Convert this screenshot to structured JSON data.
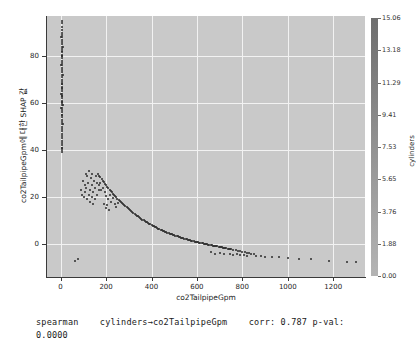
{
  "figure": {
    "background": "#ffffff",
    "plot_background": "#c9c9c9",
    "grid_color": "#f2f2f2",
    "point_color": "#2b2b2b"
  },
  "chart_data": {
    "type": "scatter",
    "title": "",
    "xlabel": "co2TailpipeGpm",
    "ylabel": "co2TailpipeGpm에 대한 SHAP 값",
    "xlim": [
      -60,
      1340
    ],
    "ylim": [
      -14,
      97
    ],
    "xticks": [
      0,
      200,
      400,
      600,
      800,
      1000,
      1200
    ],
    "xticklabels": [
      "0",
      "200",
      "400",
      "600",
      "800",
      "1000",
      "1200"
    ],
    "yticks": [
      0,
      20,
      40,
      60,
      80
    ],
    "yticklabels": [
      "0",
      "20",
      "40",
      "60",
      "80"
    ],
    "grid": true,
    "legend": "none",
    "colorbar": {
      "label": "cylinders",
      "ticks": [
        15.06,
        13.18,
        11.29,
        9.41,
        7.53,
        5.65,
        3.76,
        1.88,
        0.0
      ],
      "ticklabels": [
        "15.06",
        "13.18",
        "11.29",
        "9.41",
        "7.53",
        "5.65",
        "3.76",
        "1.88",
        "0.00"
      ],
      "vmin": 0.0,
      "vmax": 15.06
    },
    "points": [
      [
        4,
        95
      ],
      [
        6,
        94
      ],
      [
        5,
        92.5
      ],
      [
        7,
        91
      ],
      [
        4,
        90
      ],
      [
        6,
        89
      ],
      [
        5,
        88
      ],
      [
        7,
        87
      ],
      [
        4,
        86
      ],
      [
        6,
        85
      ],
      [
        5,
        84
      ],
      [
        7,
        83
      ],
      [
        4,
        82
      ],
      [
        6,
        81.5
      ],
      [
        5,
        80.5
      ],
      [
        7,
        80
      ],
      [
        4,
        79
      ],
      [
        6,
        78
      ],
      [
        5,
        77
      ],
      [
        7,
        76
      ],
      [
        4,
        75
      ],
      [
        6,
        74
      ],
      [
        5,
        73
      ],
      [
        7,
        72
      ],
      [
        4,
        71
      ],
      [
        6,
        70
      ],
      [
        5,
        69
      ],
      [
        7,
        68
      ],
      [
        4,
        67
      ],
      [
        6,
        66.5
      ],
      [
        5,
        66
      ],
      [
        7,
        65
      ],
      [
        4,
        64
      ],
      [
        6,
        63
      ],
      [
        5,
        62
      ],
      [
        7,
        61
      ],
      [
        4,
        60.5
      ],
      [
        6,
        60
      ],
      [
        5,
        59
      ],
      [
        7,
        58
      ],
      [
        4,
        57
      ],
      [
        6,
        56
      ],
      [
        5,
        55
      ],
      [
        7,
        54
      ],
      [
        4,
        53
      ],
      [
        6,
        52
      ],
      [
        5,
        51
      ],
      [
        7,
        50
      ],
      [
        4,
        49
      ],
      [
        6,
        48
      ],
      [
        5,
        47
      ],
      [
        7,
        46
      ],
      [
        4,
        45
      ],
      [
        6,
        44
      ],
      [
        5,
        43
      ],
      [
        7,
        42
      ],
      [
        4,
        41
      ],
      [
        6,
        40
      ],
      [
        8,
        68
      ],
      [
        9,
        72
      ],
      [
        8,
        80
      ],
      [
        9,
        84
      ],
      [
        8,
        63
      ],
      [
        9,
        59
      ],
      [
        8,
        55
      ],
      [
        9,
        51
      ],
      [
        3,
        88
      ],
      [
        3,
        76
      ],
      [
        3,
        64
      ],
      [
        3,
        58
      ],
      [
        5,
        41
      ],
      [
        7,
        39
      ],
      [
        110,
        30
      ],
      [
        118,
        29
      ],
      [
        125,
        31
      ],
      [
        132,
        28
      ],
      [
        140,
        30
      ],
      [
        148,
        27
      ],
      [
        155,
        29
      ],
      [
        162,
        26
      ],
      [
        98,
        27
      ],
      [
        105,
        25
      ],
      [
        112,
        24
      ],
      [
        120,
        26
      ],
      [
        128,
        23
      ],
      [
        136,
        25
      ],
      [
        144,
        22
      ],
      [
        152,
        24
      ],
      [
        160,
        21
      ],
      [
        168,
        23
      ],
      [
        88,
        23
      ],
      [
        95,
        21
      ],
      [
        102,
        20
      ],
      [
        109,
        22
      ],
      [
        116,
        19
      ],
      [
        123,
        21
      ],
      [
        130,
        18
      ],
      [
        137,
        20
      ],
      [
        144,
        17
      ],
      [
        151,
        19
      ],
      [
        165,
        30
      ],
      [
        170,
        29
      ],
      [
        175,
        28.5
      ],
      [
        180,
        27.8
      ],
      [
        185,
        27
      ],
      [
        190,
        26.3
      ],
      [
        195,
        25.7
      ],
      [
        200,
        25
      ],
      [
        205,
        24.4
      ],
      [
        210,
        23.8
      ],
      [
        215,
        23.2
      ],
      [
        220,
        22.6
      ],
      [
        225,
        22
      ],
      [
        230,
        21.5
      ],
      [
        235,
        21
      ],
      [
        240,
        20.4
      ],
      [
        245,
        19.9
      ],
      [
        250,
        19.4
      ],
      [
        255,
        18.9
      ],
      [
        260,
        18.4
      ],
      [
        265,
        17.9
      ],
      [
        270,
        17.4
      ],
      [
        275,
        17
      ],
      [
        280,
        16.5
      ],
      [
        285,
        16.1
      ],
      [
        290,
        15.6
      ],
      [
        295,
        15.2
      ],
      [
        300,
        14.8
      ],
      [
        305,
        14.4
      ],
      [
        310,
        14
      ],
      [
        315,
        13.6
      ],
      [
        320,
        13.2
      ],
      [
        325,
        12.8
      ],
      [
        330,
        12.5
      ],
      [
        335,
        12.1
      ],
      [
        340,
        11.8
      ],
      [
        345,
        11.4
      ],
      [
        350,
        11.1
      ],
      [
        355,
        10.8
      ],
      [
        360,
        10.4
      ],
      [
        365,
        10.1
      ],
      [
        370,
        9.8
      ],
      [
        375,
        9.5
      ],
      [
        380,
        9.2
      ],
      [
        385,
        8.9
      ],
      [
        390,
        8.6
      ],
      [
        395,
        8.4
      ],
      [
        400,
        8.1
      ],
      [
        405,
        7.8
      ],
      [
        410,
        7.6
      ],
      [
        415,
        7.3
      ],
      [
        420,
        7.1
      ],
      [
        425,
        6.8
      ],
      [
        430,
        6.6
      ],
      [
        435,
        6.4
      ],
      [
        440,
        6.1
      ],
      [
        445,
        5.9
      ],
      [
        450,
        5.7
      ],
      [
        455,
        5.5
      ],
      [
        460,
        5.3
      ],
      [
        465,
        5.1
      ],
      [
        470,
        4.9
      ],
      [
        475,
        4.7
      ],
      [
        480,
        4.5
      ],
      [
        485,
        4.3
      ],
      [
        490,
        4.1
      ],
      [
        495,
        3.9
      ],
      [
        500,
        3.8
      ],
      [
        505,
        3.6
      ],
      [
        510,
        3.4
      ],
      [
        515,
        3.3
      ],
      [
        520,
        3.1
      ],
      [
        525,
        2.9
      ],
      [
        530,
        2.8
      ],
      [
        535,
        2.6
      ],
      [
        540,
        2.5
      ],
      [
        545,
        2.3
      ],
      [
        550,
        2.2
      ],
      [
        555,
        2
      ],
      [
        560,
        1.9
      ],
      [
        565,
        1.8
      ],
      [
        570,
        1.6
      ],
      [
        575,
        1.5
      ],
      [
        580,
        1.4
      ],
      [
        585,
        1.2
      ],
      [
        590,
        1.1
      ],
      [
        595,
        1
      ],
      [
        600,
        0.9
      ],
      [
        605,
        0.8
      ],
      [
        610,
        0.6
      ],
      [
        615,
        0.5
      ],
      [
        620,
        0.4
      ],
      [
        625,
        0.3
      ],
      [
        630,
        0.2
      ],
      [
        635,
        0.1
      ],
      [
        640,
        0
      ],
      [
        645,
        -0.1
      ],
      [
        650,
        -0.2
      ],
      [
        655,
        -0.3
      ],
      [
        660,
        -0.4
      ],
      [
        665,
        -0.5
      ],
      [
        670,
        -0.6
      ],
      [
        675,
        -0.7
      ],
      [
        680,
        -0.8
      ],
      [
        685,
        -0.9
      ],
      [
        690,
        -1
      ],
      [
        695,
        -1.1
      ],
      [
        700,
        -1.2
      ],
      [
        705,
        -1.3
      ],
      [
        710,
        -1.4
      ],
      [
        715,
        -1.5
      ],
      [
        720,
        -1.6
      ],
      [
        725,
        -1.7
      ],
      [
        730,
        -1.8
      ],
      [
        735,
        -1.9
      ],
      [
        740,
        -2
      ],
      [
        745,
        -2.1
      ],
      [
        750,
        -2.2
      ],
      [
        760,
        -2.4
      ],
      [
        770,
        -2.6
      ],
      [
        780,
        -2.8
      ],
      [
        790,
        -3
      ],
      [
        800,
        -3.2
      ],
      [
        810,
        -3.4
      ],
      [
        820,
        -3.6
      ],
      [
        830,
        -3.8
      ],
      [
        840,
        -4
      ],
      [
        850,
        -4.2
      ],
      [
        185,
        24
      ],
      [
        193,
        22
      ],
      [
        200,
        20.5
      ],
      [
        208,
        19
      ],
      [
        215,
        21
      ],
      [
        222,
        18
      ],
      [
        230,
        19.5
      ],
      [
        238,
        17
      ],
      [
        245,
        16
      ],
      [
        252,
        17.5
      ],
      [
        190,
        17
      ],
      [
        198,
        15.5
      ],
      [
        206,
        16.5
      ],
      [
        214,
        14.5
      ],
      [
        175,
        26
      ],
      [
        178,
        23
      ],
      [
        168,
        25
      ],
      [
        660,
        -3.5
      ],
      [
        680,
        -4
      ],
      [
        700,
        -3.8
      ],
      [
        720,
        -4.2
      ],
      [
        745,
        -4
      ],
      [
        760,
        -4.5
      ],
      [
        775,
        -4.3
      ],
      [
        790,
        -4.8
      ],
      [
        805,
        -4.6
      ],
      [
        820,
        -5
      ],
      [
        860,
        -5.2
      ],
      [
        880,
        -5
      ],
      [
        900,
        -5.4
      ],
      [
        930,
        -5.6
      ],
      [
        960,
        -5.5
      ],
      [
        1000,
        -6
      ],
      [
        1050,
        -6.2
      ],
      [
        1100,
        -6.5
      ],
      [
        1180,
        -7
      ],
      [
        1260,
        -7.5
      ],
      [
        1300,
        -7.8
      ],
      [
        62,
        -7
      ],
      [
        75,
        -6.5
      ]
    ]
  },
  "caption": {
    "line1": "spearman    cylinders→co2TailpipeGpm    corr: 0.787 p-val:",
    "line2": "0.0000",
    "method": "spearman",
    "relation": "cylinders→co2TailpipeGpm",
    "corr_label": "corr:",
    "corr_value": "0.787",
    "pval_label": "p-val:",
    "pval_value": "0.0000"
  }
}
